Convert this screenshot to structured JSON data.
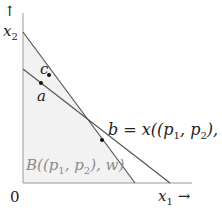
{
  "diagram": {
    "axes": {
      "y_label": "x₂",
      "y_arrow": "↑",
      "x_label": "x₁",
      "x_arrow": "→",
      "origin": "0"
    },
    "budget_set_label": "B((p₁, p₂), w)",
    "points": {
      "a": "a",
      "b": "b = x((p₁, p₂), w)",
      "c": "c"
    },
    "colors": {
      "line": "#555555",
      "fill": "#f2f2f2",
      "axis": "#999999",
      "point": "#111111",
      "budget_label": "#8a8a8a"
    }
  }
}
